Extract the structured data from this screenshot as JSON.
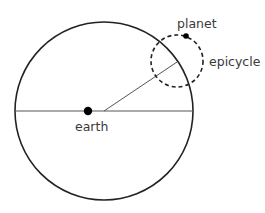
{
  "diagram": {
    "type": "ptolemaic-epicycle",
    "labels": {
      "planet": "planet",
      "epicycle": "epicycle",
      "earth": "earth"
    },
    "colors": {
      "stroke": "#222222",
      "thin_line": "#555555",
      "text": "#3a3a3a",
      "background": "#ffffff"
    }
  }
}
